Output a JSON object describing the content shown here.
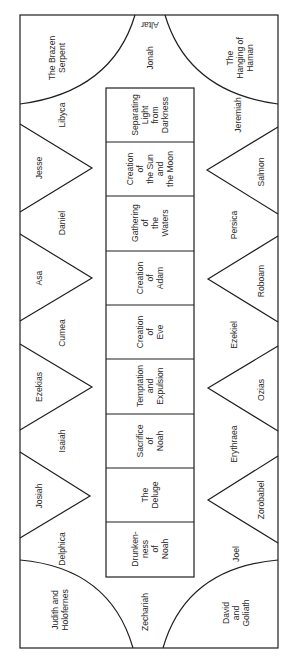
{
  "altar_label": "Altar",
  "corners": {
    "top_left": [
      "The Brazen",
      "Serpent"
    ],
    "top_right": [
      "The",
      "Hanging of",
      "Haman"
    ],
    "bottom_left": [
      "Judith and",
      "Holofernes"
    ],
    "bottom_right": [
      "David",
      "and",
      "Goliath"
    ]
  },
  "end_prophets": {
    "top": "Jonah",
    "bottom": "Zechariah"
  },
  "left_side": {
    "seers": [
      "Libyca",
      "Daniel",
      "Cumea",
      "Isaiah",
      "Delphica"
    ],
    "ancestors": [
      "Jesse",
      "Asa",
      "Ezekias",
      "Josiah"
    ]
  },
  "right_side": {
    "seers": [
      "Jeremiah",
      "Persica",
      "Ezekiel",
      "Erythraea",
      "Joel"
    ],
    "ancestors": [
      "Salmon",
      "Roboam",
      "Ozias",
      "Zorobabel"
    ]
  },
  "central_panels": [
    [
      "Separating",
      "Light",
      "from",
      "Darkness"
    ],
    [
      "Creation",
      "of",
      "the Sun",
      "and",
      "the Moon"
    ],
    [
      "Gathering",
      "of",
      "the",
      "Waters"
    ],
    [
      "Creation",
      "of",
      "Adam"
    ],
    [
      "Creation",
      "of",
      "Eve"
    ],
    [
      "Temptation",
      "and",
      "Expulsion"
    ],
    [
      "Sacrifice",
      "of",
      "Noah"
    ],
    [
      "The",
      "Deluge"
    ],
    [
      "Drunken-",
      "ness",
      "of",
      "Noah"
    ]
  ],
  "colors": {
    "line": "#1f1f1f",
    "text": "#2a2a2a",
    "background": "#ffffff"
  }
}
